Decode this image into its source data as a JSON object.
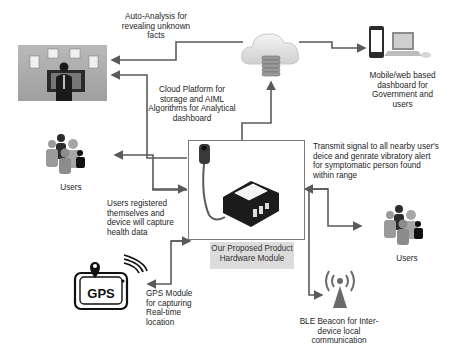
{
  "diagram": {
    "nodes": {
      "analytics_person": {
        "label": ""
      },
      "cloud": {
        "label": ""
      },
      "dashboard_devices": {
        "label": "Mobile/web based dashboard for Government and users"
      },
      "users_left": {
        "label": "Users"
      },
      "users_right": {
        "label": "Users"
      },
      "hardware_module": {
        "label": "Our Proposed Product Hardware Module"
      },
      "gps_module": {
        "icon_text": "GPS"
      },
      "ble_beacon": {
        "label": ""
      }
    },
    "edge_labels": {
      "auto_analysis": "Auto-Analysis for revealing unknown facts",
      "cloud_platform": "Cloud Platform for storage and AIML Algorithms for Analytical dashboard",
      "transmit_signal": "Transmit signal to all nearby user's deice and genrate vibratory alert for symptomatic person found within range",
      "users_registered": "Users registered themselves and device will capture health data",
      "gps_label": "GPS Module for capturing Real-time location",
      "ble_label": "BLE Beacon for Inter-device local communication"
    },
    "colors": {
      "line": "#5a5a5a",
      "caption_bg": "#dcdcdc",
      "dark_gray": "#2b2b2b",
      "mid_gray": "#8c8c8c"
    }
  }
}
